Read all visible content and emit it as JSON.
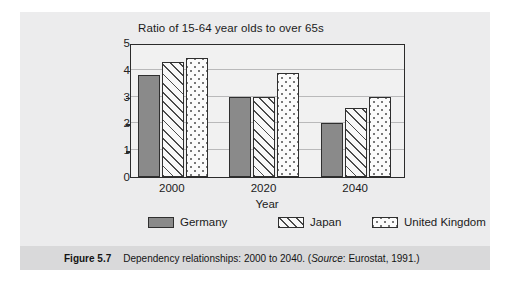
{
  "figure": {
    "caption_label": "Figure 5.7",
    "caption_text": "Dependency relationships: 2000 to 2040. (",
    "caption_source_label": "Source",
    "caption_source_value": ": Eurostat, 1991.)"
  },
  "chart_data": {
    "type": "bar",
    "title": "Ratio of 15-64 year olds to over 65s",
    "xlabel": "Year",
    "ylabel": "",
    "categories": [
      "2000",
      "2020",
      "2040"
    ],
    "yticks": [
      "5",
      "4",
      "3",
      "2",
      "1",
      "0"
    ],
    "ylim": [
      0,
      5
    ],
    "grid": true,
    "legend_position": "bottom",
    "series": [
      {
        "name": "Germany",
        "pattern": "solid-gray",
        "color": "#8a8a8a",
        "values": [
          3.8,
          3.0,
          2.0
        ]
      },
      {
        "name": "Japan",
        "pattern": "diagonal-hatch",
        "color": "#f8f8f8",
        "values": [
          4.3,
          3.0,
          2.57
        ]
      },
      {
        "name": "United Kingdom",
        "pattern": "dotted",
        "color": "#fbfbfb",
        "values": [
          4.45,
          3.87,
          2.98
        ]
      }
    ]
  }
}
